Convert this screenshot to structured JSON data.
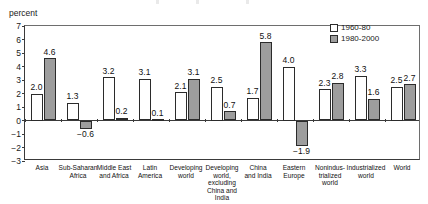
{
  "axis": {
    "unit_label": "percent",
    "yticks": [
      "7",
      "6",
      "5",
      "4",
      "3",
      "2",
      "1",
      "0",
      "-1",
      "-2",
      "-3"
    ]
  },
  "legend": {
    "items": [
      {
        "label": "1960-80",
        "swatch": "white-square-icon",
        "color": "#ffffff"
      },
      {
        "label": "1980-2000",
        "swatch": "gray-square-icon",
        "color": "#9d9d9d"
      }
    ]
  },
  "chart_data": {
    "type": "bar",
    "title": "",
    "subtitle": "",
    "xlabel": "",
    "ylabel": "percent",
    "ylim": [
      -3,
      7
    ],
    "ytick_step": 1,
    "grid": false,
    "legend_position": "top-right",
    "categories": [
      "Asia",
      "Sub-Saharan Africa",
      "Middle East and Africa",
      "Latin America",
      "Developing world",
      "Developing world, excluding China and India",
      "China and India",
      "Eastern Europe",
      "Nonindustrialized world",
      "Industrialized world",
      "World"
    ],
    "category_lines": [
      [
        "Asia"
      ],
      [
        "Sub-Saharan",
        "Africa"
      ],
      [
        "Middle East",
        "and Africa"
      ],
      [
        "Latin",
        "America"
      ],
      [
        "Developing",
        "world"
      ],
      [
        "Developing",
        "world,",
        "excluding",
        "China and",
        "India"
      ],
      [
        "China",
        "and India"
      ],
      [
        "Eastern",
        "Europe"
      ],
      [
        "Nonindus-",
        "trialized",
        "world"
      ],
      [
        "Industrialized",
        "world"
      ],
      [
        "World"
      ]
    ],
    "series": [
      {
        "name": "1960-80",
        "color": "#ffffff",
        "values": [
          2.0,
          1.3,
          3.2,
          3.1,
          2.1,
          2.5,
          1.7,
          4.0,
          2.3,
          3.3,
          2.5
        ],
        "labels": [
          "2.0",
          "1.3",
          "3.2",
          "3.1",
          "2.1",
          "2.5",
          "1.7",
          "4.0",
          "2.3",
          "3.3",
          "2.5"
        ]
      },
      {
        "name": "1980-2000",
        "color": "#9d9d9d",
        "values": [
          4.6,
          -0.6,
          0.2,
          0.1,
          3.1,
          0.7,
          5.8,
          -1.9,
          2.8,
          1.6,
          2.7
        ],
        "labels": [
          "4.6",
          "-0.6",
          "0.2",
          "0.1",
          "3.1",
          "0.7",
          "5.8",
          "-1.9",
          "2.8",
          "1.6",
          "2.7"
        ]
      }
    ]
  }
}
